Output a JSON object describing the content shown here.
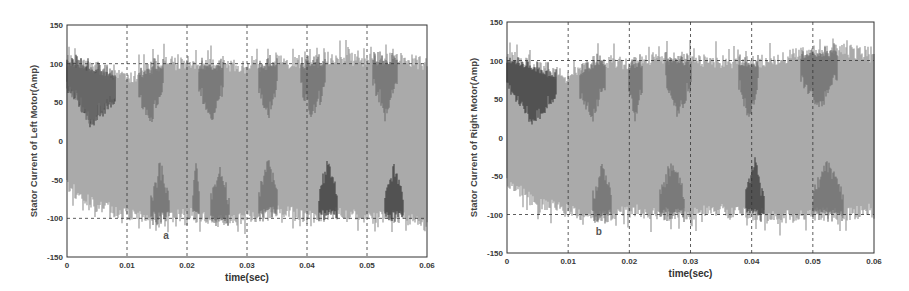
{
  "chart_data": [
    {
      "type": "line",
      "panel": "a",
      "title": "",
      "annotation": "a",
      "xlabel": "time(sec)",
      "ylabel": "Stator Current of Left Motor(Amp)",
      "xlim": [
        0,
        0.06
      ],
      "ylim": [
        -150,
        150
      ],
      "xticks": [
        "0",
        "0.01",
        "0.02",
        "0.03",
        "0.04",
        "0.05",
        "0.06"
      ],
      "yticks": [
        "150",
        "100",
        "50",
        "0",
        "-50",
        "-100",
        "-150"
      ],
      "grid": "dashed at x ticks and y = ±100",
      "series": [
        {
          "name": "phase current (dense oscillation, overlapped phases)",
          "envelope_upper_approx": 100,
          "envelope_lower_approx": -100,
          "peak_max_approx": 118,
          "peak_min_approx": -115
        }
      ],
      "envelope_x": [
        0,
        0.005,
        0.01,
        0.015,
        0.02,
        0.025,
        0.03,
        0.035,
        0.04,
        0.045,
        0.05,
        0.055,
        0.06
      ],
      "envelope_upper": [
        105,
        95,
        80,
        100,
        98,
        100,
        95,
        105,
        100,
        110,
        105,
        108,
        100
      ],
      "envelope_lower": [
        -60,
        -85,
        -95,
        -100,
        -95,
        -105,
        -100,
        -90,
        -100,
        -95,
        -100,
        -98,
        -110
      ]
    },
    {
      "type": "line",
      "panel": "b",
      "title": "",
      "annotation": "b",
      "xlabel": "time(sec)",
      "ylabel": "Stator Current of Right Motor(Amp)",
      "xlim": [
        0,
        0.06
      ],
      "ylim": [
        -150,
        150
      ],
      "xticks": [
        "0",
        "0.01",
        "0.02",
        "0.03",
        "0.04",
        "0.05",
        "0.06"
      ],
      "yticks": [
        "150",
        "100",
        "50",
        "0",
        "-50",
        "-100",
        "-150"
      ],
      "grid": "dashed at x ticks and y = ±100",
      "series": [
        {
          "name": "phase current (dense oscillation, overlapped phases)",
          "envelope_upper_approx": 100,
          "envelope_lower_approx": -100,
          "peak_max_approx": 118,
          "peak_min_approx": -112
        }
      ],
      "envelope_x": [
        0,
        0.005,
        0.01,
        0.015,
        0.02,
        0.025,
        0.03,
        0.035,
        0.04,
        0.045,
        0.05,
        0.055,
        0.06
      ],
      "envelope_upper": [
        105,
        92,
        80,
        102,
        95,
        105,
        100,
        100,
        98,
        105,
        112,
        115,
        105
      ],
      "envelope_lower": [
        -60,
        -85,
        -95,
        -105,
        -95,
        -100,
        -100,
        -95,
        -100,
        -105,
        -100,
        -102,
        -95
      ]
    }
  ],
  "colors": {
    "fill_light": "#9a9a9a",
    "fill_mid": "#6e6e6e",
    "fill_dark": "#3c3c3c",
    "axis": "#333333",
    "grid": "#333333",
    "background": "#ffffff"
  }
}
